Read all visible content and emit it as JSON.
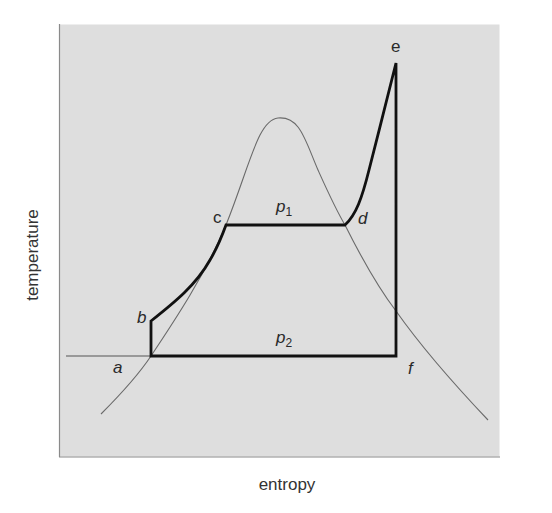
{
  "diagram": {
    "type": "Temperature-entropy (T-s) diagram of a Rankine cycle with superheat",
    "colors": {
      "background": "#ffffff",
      "panel": "#dedede",
      "panel_border": "#8a8a8a",
      "cycle_line": "#111111",
      "saturation_dome": "#6a6a6a"
    },
    "axes": {
      "x_label": "entropy",
      "y_label": "temperature"
    },
    "points": {
      "a": "a",
      "b": "b",
      "c": "c",
      "d": "d",
      "e": "e",
      "f": "f"
    },
    "pressure_labels": {
      "p1": {
        "base": "p",
        "sub": "1"
      },
      "p2": {
        "base": "p",
        "sub": "2"
      }
    },
    "processes": [
      {
        "from": "a",
        "to": "b",
        "description": "vertical (isentropic pump compression)"
      },
      {
        "from": "b",
        "to": "c",
        "description": "heating along p1 to saturated liquid"
      },
      {
        "from": "c",
        "to": "d",
        "description": "constant-temperature evaporation at p1"
      },
      {
        "from": "d",
        "to": "e",
        "description": "superheating"
      },
      {
        "from": "e",
        "to": "f",
        "description": "vertical (isentropic expansion)"
      },
      {
        "from": "f",
        "to": "a",
        "description": "condensation at p2"
      }
    ]
  }
}
